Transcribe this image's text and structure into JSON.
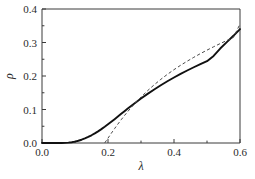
{
  "chart_data": {
    "type": "line",
    "title": "",
    "subtitle": "",
    "xlabel": "λ",
    "ylabel": "ρ",
    "xlim": [
      0.0,
      0.6
    ],
    "ylim": [
      0.0,
      0.4
    ],
    "xticks": [
      0.0,
      0.2,
      0.4,
      0.6
    ],
    "xtick_labels": [
      "0.0",
      "0.2",
      "0.4",
      "0.6"
    ],
    "xminor_ticks": [
      0.1,
      0.3,
      0.5
    ],
    "yticks": [
      0.0,
      0.1,
      0.2,
      0.3,
      0.4
    ],
    "ytick_labels": [
      "0.0",
      "0.1",
      "0.2",
      "0.3",
      "0.4"
    ],
    "yminor_ticks": [
      0.05,
      0.15,
      0.25,
      0.35
    ],
    "grid": false,
    "legend": null,
    "legend_position": "none",
    "series": [
      {
        "name": "solid-curve",
        "style": "solid",
        "color": "#111111",
        "x": [
          0.0,
          0.02,
          0.04,
          0.06,
          0.07,
          0.08,
          0.09,
          0.1,
          0.11,
          0.12,
          0.13,
          0.14,
          0.15,
          0.16,
          0.17,
          0.18,
          0.19,
          0.2,
          0.21,
          0.22,
          0.23,
          0.24,
          0.25,
          0.26,
          0.27,
          0.28,
          0.29,
          0.3,
          0.32,
          0.34,
          0.36,
          0.38,
          0.4,
          0.42,
          0.44,
          0.46,
          0.48,
          0.5,
          0.52,
          0.54,
          0.56,
          0.58,
          0.6
        ],
        "y": [
          0.0,
          0.0,
          0.0,
          0.0002,
          0.0005,
          0.0012,
          0.0024,
          0.0042,
          0.0067,
          0.0098,
          0.0136,
          0.018,
          0.023,
          0.0286,
          0.0348,
          0.0414,
          0.0484,
          0.0558,
          0.0634,
          0.0712,
          0.0791,
          0.087,
          0.0949,
          0.1027,
          0.1104,
          0.118,
          0.1254,
          0.1327,
          0.1466,
          0.1598,
          0.1723,
          0.1842,
          0.1955,
          0.2062,
          0.2164,
          0.2261,
          0.2354,
          0.2443,
          0.26,
          0.282,
          0.301,
          0.32,
          0.34
        ]
      },
      {
        "name": "dashed-curve",
        "style": "dashed",
        "color": "#4a4a4a",
        "x": [
          0.19,
          0.2,
          0.21,
          0.22,
          0.23,
          0.24,
          0.25,
          0.26,
          0.27,
          0.28,
          0.29,
          0.3,
          0.32,
          0.34,
          0.36,
          0.38,
          0.4,
          0.42,
          0.44,
          0.46,
          0.48,
          0.5,
          0.52,
          0.54,
          0.56,
          0.58,
          0.6
        ],
        "y": [
          0.0,
          0.0145,
          0.029,
          0.043,
          0.0565,
          0.0695,
          0.082,
          0.094,
          0.1055,
          0.1165,
          0.127,
          0.1372,
          0.1562,
          0.1738,
          0.19,
          0.205,
          0.219,
          0.232,
          0.2442,
          0.2558,
          0.2668,
          0.2772,
          0.2872,
          0.2968,
          0.306,
          0.315,
          0.355
        ]
      }
    ]
  }
}
